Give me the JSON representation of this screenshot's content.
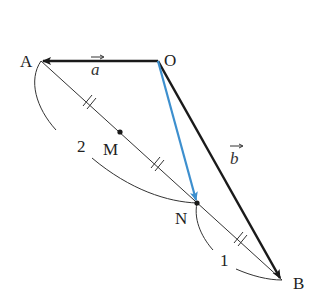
{
  "points": {
    "O": "O",
    "A": "A",
    "B": "B",
    "M": "M",
    "N": "N"
  },
  "vectors": {
    "a": "a",
    "b": "b"
  },
  "ratio_labels": {
    "AN": "2",
    "NB": "1"
  },
  "colors": {
    "main": "#1a1a1a",
    "highlight": "#3d8fce",
    "thin": "#333333"
  }
}
